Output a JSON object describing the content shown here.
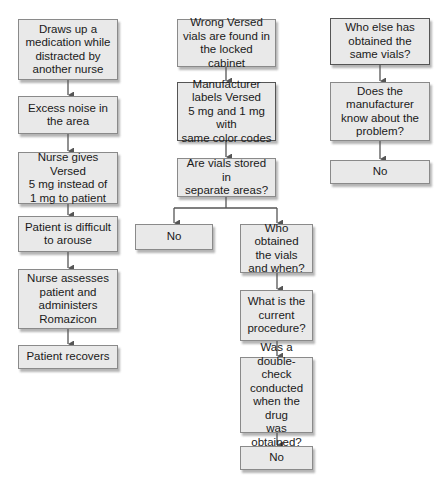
{
  "diagram": {
    "type": "flowchart",
    "columns": [
      {
        "id": "left",
        "nodes": [
          {
            "id": "l1",
            "text": "Draws up a\nmedication while\ndistracted by\nanother nurse"
          },
          {
            "id": "l2",
            "text": "Excess noise in\nthe area"
          },
          {
            "id": "l3",
            "text": "Nurse gives Versed\n5 mg instead of\n1 mg to patient"
          },
          {
            "id": "l4",
            "text": "Patient is difficult\nto arouse"
          },
          {
            "id": "l5",
            "text": "Nurse assesses\npatient and\nadministers\nRomazicon"
          },
          {
            "id": "l6",
            "text": "Patient recovers"
          }
        ]
      },
      {
        "id": "middle",
        "nodes": [
          {
            "id": "m1",
            "text": "Wrong Versed\nvials are found in\nthe locked cabinet"
          },
          {
            "id": "m2",
            "text": "Manufacturer\nlabels Versed\n5 mg and 1 mg with\nsame color codes"
          },
          {
            "id": "m3",
            "text": "Are vials stored in\nseparate areas?"
          },
          {
            "id": "m4",
            "text": "No"
          },
          {
            "id": "m5",
            "text": "Who obtained\nthe vials\nand when?"
          },
          {
            "id": "m6",
            "text": "What is the\ncurrent\nprocedure?"
          },
          {
            "id": "m7",
            "text": "Was a\ndouble-check\nconducted\nwhen the drug\nwas obtained?"
          },
          {
            "id": "m8",
            "text": "No"
          }
        ]
      },
      {
        "id": "right",
        "nodes": [
          {
            "id": "r1",
            "text": "Who else has\nobtained the\nsame vials?"
          },
          {
            "id": "r2",
            "text": "Does the\nmanufacturer\nknow about the\nproblem?"
          },
          {
            "id": "r3",
            "text": "No"
          }
        ]
      }
    ],
    "edges": [
      [
        "l1",
        "l2"
      ],
      [
        "l2",
        "l3"
      ],
      [
        "l3",
        "l4"
      ],
      [
        "l4",
        "l5"
      ],
      [
        "l5",
        "l6"
      ],
      [
        "m1",
        "m2"
      ],
      [
        "m2",
        "m3"
      ],
      [
        "m3",
        "m4"
      ],
      [
        "m3",
        "m5"
      ],
      [
        "m5",
        "m6"
      ],
      [
        "m6",
        "m7"
      ],
      [
        "m7",
        "m8"
      ],
      [
        "r1",
        "r2"
      ],
      [
        "r2",
        "r3"
      ]
    ],
    "colors": {
      "box_fill": "#e9e9e9",
      "box_border": "#8a8a8a",
      "arrow": "#555555"
    }
  }
}
